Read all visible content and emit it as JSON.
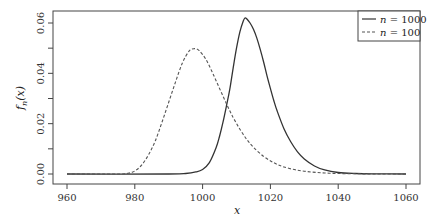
{
  "chart_data": {
    "type": "line",
    "title": "",
    "xlabel": "x",
    "ylabel": "f_n(x)",
    "xlim": [
      957,
      1063
    ],
    "ylim": [
      -0.001,
      0.0648
    ],
    "x_ticks": [
      960,
      980,
      1000,
      1020,
      1040,
      1060
    ],
    "x_tick_labels": [
      "960",
      "980",
      "1000",
      "1020",
      "1040",
      "1060"
    ],
    "y_ticks": [
      0.0,
      0.01,
      0.02,
      0.03,
      0.04,
      0.05,
      0.06
    ],
    "y_tick_labels": [
      "0.00",
      "",
      "0.02",
      "",
      "0.04",
      "",
      "0.06"
    ],
    "grid": false,
    "legend_position": "top-right",
    "series": [
      {
        "name": "n = 1000",
        "legend_n": "n",
        "legend_value": "1000",
        "line_style": "solid",
        "color": "#333333",
        "x": [
          960,
          990,
          995,
          998,
          1000,
          1002,
          1004,
          1005,
          1006,
          1007,
          1008,
          1009,
          1010,
          1011,
          1012,
          1012.5,
          1013,
          1014,
          1015,
          1016,
          1017,
          1018,
          1019,
          1020,
          1021,
          1022,
          1024,
          1026,
          1028,
          1030,
          1033,
          1036,
          1040,
          1045,
          1050,
          1060
        ],
        "y": [
          0.0,
          0.0,
          0.0002,
          0.0008,
          0.0018,
          0.0045,
          0.0105,
          0.015,
          0.0205,
          0.0268,
          0.0335,
          0.042,
          0.05,
          0.0565,
          0.0608,
          0.062,
          0.0617,
          0.06,
          0.0575,
          0.054,
          0.0495,
          0.0445,
          0.039,
          0.034,
          0.0292,
          0.025,
          0.018,
          0.0128,
          0.0088,
          0.006,
          0.0032,
          0.0016,
          0.0006,
          0.0002,
          5e-05,
          0.0
        ]
      },
      {
        "name": "n = 100",
        "legend_n": "n",
        "legend_value": "100",
        "line_style": "dashed",
        "color": "#555555",
        "x": [
          960,
          975,
          978,
          980,
          982,
          984,
          986,
          988,
          990,
          992,
          994,
          996,
          997.5,
          999,
          1001,
          1003,
          1005,
          1007,
          1009,
          1011,
          1013,
          1015,
          1018,
          1021,
          1024,
          1028,
          1032,
          1036,
          1040,
          1045,
          1050,
          1060
        ],
        "y": [
          0.0,
          0.0,
          0.0003,
          0.0012,
          0.0035,
          0.0075,
          0.013,
          0.0205,
          0.0285,
          0.0365,
          0.044,
          0.0488,
          0.0498,
          0.049,
          0.0455,
          0.04,
          0.034,
          0.028,
          0.0225,
          0.0178,
          0.0138,
          0.0106,
          0.007,
          0.0045,
          0.0028,
          0.0015,
          0.0008,
          0.0004,
          0.0002,
          0.0001,
          3e-05,
          0.0
        ]
      }
    ]
  }
}
